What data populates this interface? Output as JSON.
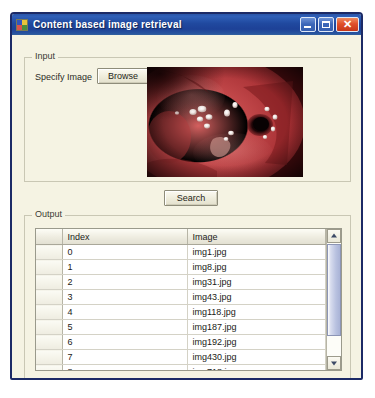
{
  "window": {
    "title": "Content based image retrieval",
    "icon": "application-icon",
    "controls": {
      "minimize_label": "",
      "maximize_label": "",
      "close_label": "✕"
    }
  },
  "input_group": {
    "legend": "Input",
    "specify_image_label": "Specify Image",
    "browse_label": "Browse",
    "preview_alt": "endoscopic-image-preview"
  },
  "search_button_label": "Search",
  "output_group": {
    "legend": "Output",
    "columns": [
      "",
      "Index",
      "Image"
    ],
    "rows": [
      {
        "index": "0",
        "image": "img1.jpg"
      },
      {
        "index": "1",
        "image": "img8.jpg"
      },
      {
        "index": "2",
        "image": "img31.jpg"
      },
      {
        "index": "3",
        "image": "img43.jpg"
      },
      {
        "index": "4",
        "image": "img118.jpg"
      },
      {
        "index": "5",
        "image": "img187.jpg"
      },
      {
        "index": "6",
        "image": "img192.jpg"
      },
      {
        "index": "7",
        "image": "img430.jpg"
      },
      {
        "index": "8",
        "image": "img718.jpg"
      },
      {
        "index": "9",
        "image": "img887.jpg"
      }
    ]
  },
  "colors": {
    "titlebar": "#20499f",
    "window_border": "#1c2a66",
    "client_background": "#f5f3e3",
    "close_button": "#d9452a"
  }
}
